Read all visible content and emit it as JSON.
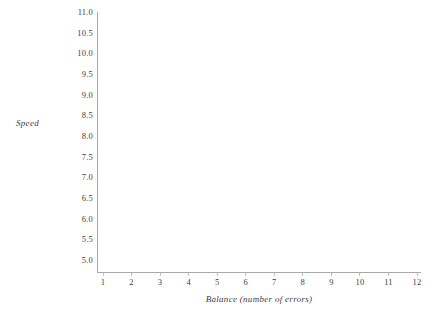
{
  "chart_data": {
    "type": "scatter",
    "title": "",
    "subtitle": "",
    "xlabel": "Balance (number of errors)",
    "ylabel": "Speed",
    "x": [],
    "values": [],
    "series": [],
    "annotations": [],
    "legend": [],
    "legend_position": "none",
    "grid": false,
    "xlim": [
      1,
      12
    ],
    "ylim": [
      5.0,
      11.0
    ],
    "xticks": [
      "1",
      "2",
      "3",
      "4",
      "5",
      "6",
      "7",
      "8",
      "9",
      "10",
      "11",
      "12"
    ],
    "yticks": [
      "11.0",
      "10.5",
      "10.0",
      "9.5",
      "9.0",
      "8.5",
      "8.0",
      "7.5",
      "7.0",
      "6.5",
      "6.0",
      "5.5",
      "5.0"
    ],
    "note": "empty plot frame, no data points drawn"
  },
  "axes": {
    "y_title": "Speed",
    "x_title": "Balance (number of errors)",
    "y_ticklabels": [
      "11.0",
      "10.5",
      "10.0",
      "9.5",
      "9.0",
      "8.5",
      "8.0",
      "7.5",
      "7.0",
      "6.5",
      "6.0",
      "5.5",
      "5.0"
    ],
    "x_ticklabels": [
      "1",
      "2",
      "3",
      "4",
      "5",
      "6",
      "7",
      "8",
      "9",
      "10",
      "11",
      "12"
    ]
  },
  "colors": {
    "background": "#ffffff",
    "axis_line": "#a9a9a9",
    "tick_mark": "#c2c2c2",
    "text": "#3d3d3d"
  }
}
